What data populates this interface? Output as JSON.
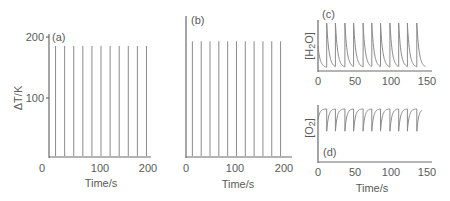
{
  "chart_data": [
    {
      "panel": "(a)",
      "type": "line",
      "title": "",
      "xlabel": "Time/s",
      "ylabel": "ΔT/K",
      "xlim": [
        0,
        200
      ],
      "ylim": [
        0,
        200
      ],
      "xticks": [
        "0",
        "100",
        "200"
      ],
      "yticks": [
        "100",
        "200"
      ],
      "grid": false,
      "description": "Periodic temperature spikes",
      "spike_times": [
        13,
        31,
        49,
        67,
        85,
        103,
        121,
        139,
        157,
        175,
        193
      ],
      "spike_height": 185,
      "baseline": 0
    },
    {
      "panel": "(b)",
      "type": "line",
      "xlabel": "Time/s",
      "ylabel": "",
      "xlim": [
        0,
        200
      ],
      "ylim": [
        0,
        200
      ],
      "xticks": [
        "0",
        "100",
        "200"
      ],
      "grid": false,
      "spike_times": [
        13,
        31,
        49,
        67,
        85,
        103,
        121,
        139,
        157,
        175,
        193
      ],
      "spike_height": 185,
      "baseline": 0
    },
    {
      "panel": "(c)",
      "type": "line",
      "xlabel": "",
      "ylabel": "[H2O]",
      "xlim": [
        0,
        150
      ],
      "xticks": [
        "0",
        "50",
        "100",
        "150"
      ],
      "grid": false,
      "description": "Sharp rise then exponential decay, repeated",
      "peak_times": [
        12,
        24,
        37,
        49,
        62,
        74,
        86,
        99,
        111,
        123,
        136
      ],
      "peak_level": 1.0,
      "trough_level": 0.05
    },
    {
      "panel": "(d)",
      "type": "line",
      "xlabel": "Time/s",
      "ylabel": "[O2]",
      "xlim": [
        0,
        150
      ],
      "xticks": [
        "0",
        "50",
        "100",
        "150"
      ],
      "grid": false,
      "description": "Sharp dips then recovery, repeated",
      "dip_times": [
        12,
        24,
        37,
        49,
        62,
        74,
        86,
        99,
        111,
        123,
        136
      ],
      "high_level": 0.95,
      "dip_level": 0.55
    }
  ],
  "labels": {
    "panel_a": "(a)",
    "panel_b": "(b)",
    "panel_c": "(c)",
    "panel_d": "(d)",
    "ylabel_a": "ΔT/K",
    "ylabel_c_main": "[H",
    "ylabel_c_sub": "2",
    "ylabel_c_end": "O]",
    "ylabel_d_main": "[O",
    "ylabel_d_sub": "2",
    "ylabel_d_end": "]",
    "xlabel": "Time/s",
    "tick_0": "0",
    "tick_50": "50",
    "tick_100": "100",
    "tick_150": "150",
    "tick_200": "200"
  }
}
